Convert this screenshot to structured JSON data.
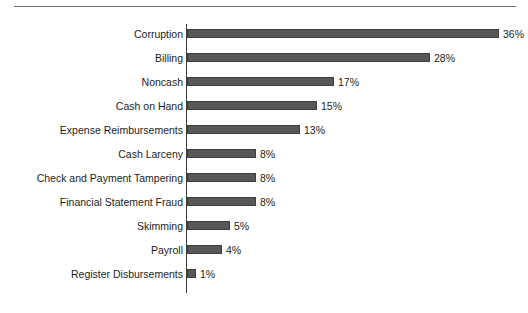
{
  "chart_data": {
    "type": "bar",
    "orientation": "horizontal",
    "title": "",
    "subtitle": "",
    "xlabel": "",
    "ylabel": "",
    "grid": false,
    "legend": false,
    "legend_position": "none",
    "value_suffix": "%",
    "xlim": [
      0,
      36
    ],
    "axis_line": "left",
    "categories": [
      "Corruption",
      "Billing",
      "Noncash",
      "Cash on Hand",
      "Expense Reimbursements",
      "Cash Larceny",
      "Check and Payment Tampering",
      "Financial Statement Fraud",
      "Skimming",
      "Payroll",
      "Register Disbursements"
    ],
    "values": [
      36,
      28,
      17,
      15,
      13,
      8,
      8,
      8,
      5,
      4,
      1
    ],
    "data_labels": [
      "36%",
      "28%",
      "17%",
      "15%",
      "13%",
      "8%",
      "8%",
      "8%",
      "5%",
      "4%",
      "1%"
    ],
    "colors": {
      "bar_fill": "#575757",
      "bar_stroke": "#3f3f3f",
      "axis": "#3a3a3a",
      "rule": "#6f6f6f",
      "text": "#1c1c1c",
      "background": "#ffffff"
    }
  }
}
